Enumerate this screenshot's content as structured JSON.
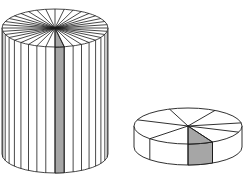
{
  "figure": {
    "colors": {
      "stroke": "#1a1a1a",
      "shade": "#a6a6a6",
      "background": "#ffffff"
    },
    "tall_cylinder": {
      "sectors": 36,
      "shaded_sectors": 1
    },
    "short_disc": {
      "sectors": 7,
      "shaded_sectors": 1
    }
  }
}
